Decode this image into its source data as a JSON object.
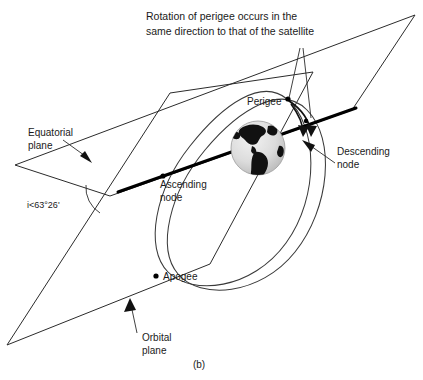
{
  "figure": {
    "caption": "(b)",
    "title_line1": "Rotation of perigee occurs in the",
    "title_line2": "same direction to that of the satellite",
    "labels": {
      "equatorial_plane_line1": "Equatorial",
      "equatorial_plane_line2": "plane",
      "orbital_plane_line1": "Orbital",
      "orbital_plane_line2": "plane",
      "ascending_node_line1": "Ascending",
      "ascending_node_line2": "node",
      "descending_node_line1": "Descending",
      "descending_node_line2": "node",
      "perigee": "Perigee",
      "apogee": "Apogee",
      "inclination": "i<63°26'"
    },
    "colors": {
      "ink": "#1a1a1a",
      "line": "#2b2b2b",
      "node_line": "#000000",
      "globe_land": "#111111",
      "globe_ocean": "#d8d8d8",
      "background": "#ffffff"
    }
  }
}
